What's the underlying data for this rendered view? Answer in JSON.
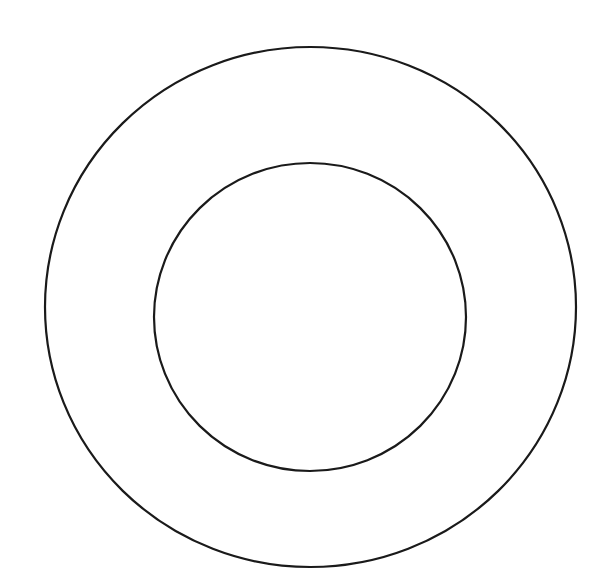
{
  "diagram": {
    "type": "concentric-circles",
    "background": "#ffffff",
    "stroke_color": "#1a1a1a",
    "stroke_width": 2.2,
    "shapes": [
      {
        "name": "outer-circle",
        "cx": 310.5,
        "cy": 307,
        "rx": 265.5,
        "ry": 260
      },
      {
        "name": "inner-circle",
        "cx": 310,
        "cy": 317,
        "rx": 156,
        "ry": 154
      }
    ]
  }
}
